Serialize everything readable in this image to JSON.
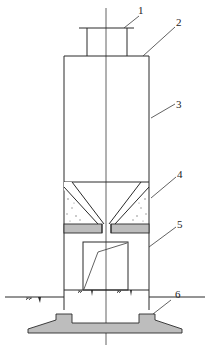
{
  "diagram": {
    "type": "engineering cross-section",
    "labels": [
      {
        "id": "1",
        "text": "1",
        "part": "top cap / inlet"
      },
      {
        "id": "2",
        "text": "2",
        "part": "roof"
      },
      {
        "id": "3",
        "text": "3",
        "part": "silo wall"
      },
      {
        "id": "4",
        "text": "4",
        "part": "hopper (concrete fill)"
      },
      {
        "id": "5",
        "text": "5",
        "part": "support structure"
      },
      {
        "id": "6",
        "text": "6",
        "part": "foundation"
      }
    ],
    "colors": {
      "line": "#2a2a2a",
      "fill_gray": "#bdbdbd",
      "background": "#ffffff"
    }
  }
}
